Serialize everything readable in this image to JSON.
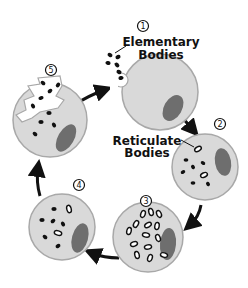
{
  "diagram": {
    "colors": {
      "cell_fill": "#d9d9d9",
      "cell_stroke": "#a8a8a8",
      "nucleus": "#6e6e6e",
      "body_dark": "#111111",
      "arrow": "#111111",
      "background": "#ffffff"
    },
    "stages": [
      {
        "number": "1",
        "label_line1": "Elementary",
        "label_line2": "Bodies"
      },
      {
        "number": "2",
        "label_line1": "Reticulate",
        "label_line2": "Bodies"
      },
      {
        "number": "3"
      },
      {
        "number": "4"
      },
      {
        "number": "5"
      }
    ],
    "arrows": [
      {
        "from": "5",
        "to": "1"
      },
      {
        "from": "1",
        "to": "2"
      },
      {
        "from": "2",
        "to": "3"
      },
      {
        "from": "3",
        "to": "4"
      },
      {
        "from": "4",
        "to": "5"
      }
    ]
  }
}
